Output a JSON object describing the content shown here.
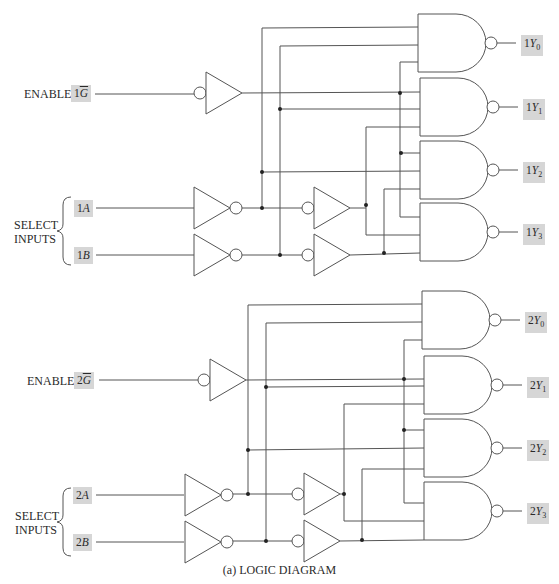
{
  "diagram": {
    "caption": "(a)  LOGIC DIAGRAM",
    "sections": [
      {
        "id": "1",
        "enable": {
          "label": "ENABLE",
          "pin_prefix": "1",
          "pin_name": "G",
          "inverted": true
        },
        "select": {
          "label_line1": "SELECT",
          "label_line2": "INPUTS",
          "inputs": [
            {
              "prefix": "1",
              "name": "A"
            },
            {
              "prefix": "1",
              "name": "B"
            }
          ]
        },
        "outputs": [
          {
            "prefix": "1",
            "name": "Y",
            "sub": "0"
          },
          {
            "prefix": "1",
            "name": "Y",
            "sub": "1"
          },
          {
            "prefix": "1",
            "name": "Y",
            "sub": "2"
          },
          {
            "prefix": "1",
            "name": "Y",
            "sub": "3"
          }
        ]
      },
      {
        "id": "2",
        "enable": {
          "label": "ENABLE",
          "pin_prefix": "2",
          "pin_name": "G",
          "inverted": true
        },
        "select": {
          "label_line1": "SELECT",
          "label_line2": "INPUTS",
          "inputs": [
            {
              "prefix": "2",
              "name": "A"
            },
            {
              "prefix": "2",
              "name": "B"
            }
          ]
        },
        "outputs": [
          {
            "prefix": "2",
            "name": "Y",
            "sub": "0"
          },
          {
            "prefix": "2",
            "name": "Y",
            "sub": "1"
          },
          {
            "prefix": "2",
            "name": "Y",
            "sub": "2"
          },
          {
            "prefix": "2",
            "name": "Y",
            "sub": "3"
          }
        ]
      }
    ],
    "components": {
      "nand_gates_per_section": 4,
      "nand_inputs": 3,
      "inverters_per_section": 3,
      "buffers_with_inverted_input_per_section": 2
    }
  }
}
